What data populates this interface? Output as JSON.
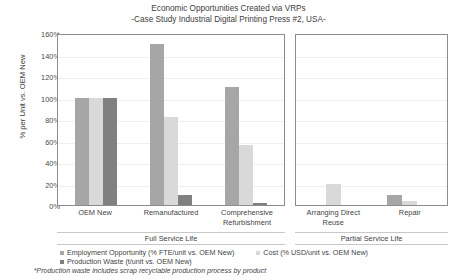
{
  "chart_data": {
    "type": "bar",
    "title": "Economic Opportunities Created via VRPs",
    "subtitle": "-Case Study Industrial Digital Printing Press #2, USA-",
    "xlabel": "",
    "ylabel": "% per Unit vs. OEM New",
    "ylim": [
      0,
      160
    ],
    "ytick_labels": [
      "160%",
      "140%",
      "120%",
      "100%",
      "80%",
      "60%",
      "40%",
      "20%",
      "0%"
    ],
    "ytick_values": [
      160,
      140,
      120,
      100,
      80,
      60,
      40,
      20,
      0
    ],
    "grid": true,
    "legend_position": "bottom",
    "panels": [
      {
        "name": "Full Service Life",
        "categories": [
          "OEM New",
          "Remanufactured",
          "Comprehensive Refurbishment"
        ],
        "series": [
          {
            "name": "Employment Opportunity (% FTE/unit vs. OEM New)",
            "color": "#a6a6a6",
            "values": [
              100,
              150,
              110
            ]
          },
          {
            "name": "Cost (% USD/unit vs. OEM New)",
            "color": "#d9d9d9",
            "values": [
              100,
              82,
              56
            ]
          },
          {
            "name": "Production Waste (t/unit vs. OEM New)",
            "color": "#808080",
            "values": [
              100,
              9,
              2
            ]
          }
        ]
      },
      {
        "name": "Partial Service Life",
        "categories": [
          "Arranging Direct Reuse",
          "Repair"
        ],
        "series": [
          {
            "name": "Employment Opportunity (% FTE/unit vs. OEM New)",
            "color": "#a6a6a6",
            "values": [
              0,
              9
            ]
          },
          {
            "name": "Cost (% USD/unit vs. OEM New)",
            "color": "#d9d9d9",
            "values": [
              20,
              4
            ]
          },
          {
            "name": "Production Waste (t/unit vs. OEM New)",
            "color": "#808080",
            "values": [
              0,
              0
            ]
          }
        ]
      }
    ],
    "legend": [
      {
        "label": "Employment Opportunity (% FTE/unit vs. OEM New)",
        "color": "#a6a6a6"
      },
      {
        "label": "Cost (% USD/unit vs. OEM New)",
        "color": "#d9d9d9"
      },
      {
        "label": "Production Waste (t/unit vs. OEM New)",
        "color": "#808080"
      }
    ],
    "footnote": "*Production waste includes scrap recyclable production process by product"
  }
}
